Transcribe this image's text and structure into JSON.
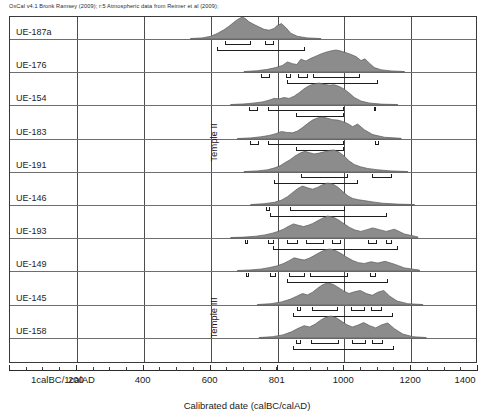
{
  "header": {
    "note": "OxCal v4.1 Bronk Ramsey (2009); r:5 Atmospheric data from Reimer et al (2009);"
  },
  "axis": {
    "title": "Calibrated date (calBC/calAD)",
    "tick_labels": [
      "1calBC/1calAD",
      "200",
      "400",
      "600",
      "801",
      "1000",
      "1200",
      "1400"
    ],
    "tick_values": [
      0,
      200,
      400,
      600,
      801,
      1000,
      1200,
      1400
    ],
    "gridline_values": [
      200,
      400,
      600,
      801,
      1000,
      1200
    ],
    "xmin": 0,
    "xmax": 1400,
    "minor_tick_step": 50
  },
  "groups": [
    {
      "label": "Temple II",
      "top": 90,
      "height": 105
    },
    {
      "label": "Temple III",
      "top": 282,
      "height": 72
    }
  ],
  "chart_data": {
    "type": "area",
    "title": "",
    "subtitle": "OxCal v4.1 Bronk Ramsey (2009); r:5 Atmospheric data from Reimer et al (2009);",
    "xlabel": "Calibrated date (calBC/calAD)",
    "ylabel": "",
    "xlim": [
      0,
      1400
    ],
    "grid": true,
    "legend": "none",
    "x_tick_labels": [
      "1calBC/1calAD",
      "200",
      "400",
      "600",
      "801",
      "1000",
      "1200",
      "1400"
    ],
    "x_tick_values": [
      0,
      200,
      400,
      600,
      801,
      1000,
      1200,
      1400
    ],
    "group_labels": [
      "Temple II",
      "Temple III"
    ],
    "series": [
      {
        "name": "UE-187a",
        "group": "Temple II",
        "curve_x": [
          540,
          575,
          600,
          620,
          640,
          655,
          668,
          680,
          695,
          705,
          715,
          725,
          735,
          745,
          760,
          775,
          790,
          800,
          812,
          825,
          840,
          860,
          890,
          930
        ],
        "curve_y": [
          0.02,
          0.05,
          0.12,
          0.25,
          0.42,
          0.58,
          0.74,
          0.88,
          1.0,
          0.92,
          0.78,
          0.7,
          0.62,
          0.55,
          0.44,
          0.4,
          0.48,
          0.62,
          0.7,
          0.52,
          0.26,
          0.12,
          0.05,
          0.02
        ],
        "ranges_68": [
          [
            642,
            720
          ],
          [
            762,
            790
          ]
        ],
        "range_95": [
          618,
          884
        ]
      },
      {
        "name": "UE-176",
        "group": "Temple II",
        "curve_x": [
          700,
          740,
          770,
          795,
          815,
          830,
          845,
          858,
          870,
          885,
          900,
          915,
          930,
          945,
          960,
          975,
          990,
          1005,
          1020,
          1035,
          1050,
          1062,
          1075,
          1090,
          1110,
          1140,
          1180
        ],
        "curve_y": [
          0.02,
          0.06,
          0.12,
          0.2,
          0.3,
          0.46,
          0.38,
          0.34,
          0.58,
          0.5,
          0.62,
          0.72,
          0.82,
          0.9,
          0.96,
          1.0,
          0.95,
          0.88,
          0.8,
          0.7,
          0.52,
          0.6,
          0.4,
          0.2,
          0.1,
          0.05,
          0.02
        ],
        "ranges_68": [
          [
            752,
            778
          ],
          [
            826,
            842
          ],
          [
            862,
            892
          ],
          [
            906,
            1048
          ]
        ],
        "range_95": [
          828,
          1102
        ]
      },
      {
        "name": "UE-154",
        "group": "Temple II",
        "curve_x": [
          660,
          700,
          730,
          755,
          775,
          790,
          805,
          820,
          835,
          850,
          865,
          880,
          895,
          910,
          925,
          940,
          955,
          970,
          985,
          1000,
          1015,
          1030,
          1050,
          1075,
          1110,
          1160
        ],
        "curve_y": [
          0.02,
          0.05,
          0.09,
          0.14,
          0.22,
          0.3,
          0.28,
          0.34,
          0.3,
          0.4,
          0.56,
          0.74,
          0.88,
          0.96,
          1.0,
          0.94,
          0.9,
          0.92,
          0.84,
          0.72,
          0.54,
          0.34,
          0.18,
          0.09,
          0.04,
          0.02
        ],
        "ranges_68": [
          [
            716,
            742
          ],
          [
            772,
            1000
          ]
        ],
        "range_95": [
          856,
          1000
        ],
        "extra_marks": [
          [
            1088,
            1096
          ]
        ]
      },
      {
        "name": "UE-183",
        "group": "Temple II",
        "curve_x": [
          680,
          720,
          750,
          775,
          795,
          812,
          828,
          845,
          860,
          875,
          890,
          905,
          920,
          935,
          950,
          965,
          980,
          995,
          1010,
          1025,
          1040,
          1060,
          1085,
          1120,
          1170
        ],
        "curve_y": [
          0.02,
          0.05,
          0.1,
          0.16,
          0.24,
          0.34,
          0.3,
          0.28,
          0.36,
          0.52,
          0.7,
          0.86,
          0.96,
          1.0,
          0.94,
          0.88,
          0.86,
          0.8,
          0.7,
          0.56,
          0.68,
          0.42,
          0.2,
          0.08,
          0.03
        ],
        "ranges_68": [
          [
            718,
            744
          ],
          [
            772,
            998
          ]
        ],
        "range_95": [
          856,
          998
        ],
        "extra_marks": [
          [
            1092,
            1104
          ]
        ]
      },
      {
        "name": "UE-191",
        "group": "Temple II",
        "curve_x": [
          700,
          740,
          770,
          790,
          808,
          822,
          838,
          852,
          868,
          882,
          896,
          910,
          925,
          940,
          955,
          970,
          985,
          1000,
          1015,
          1030,
          1048,
          1070,
          1100,
          1140,
          1190
        ],
        "curve_y": [
          0.02,
          0.05,
          0.1,
          0.18,
          0.28,
          0.42,
          0.56,
          0.72,
          0.86,
          0.94,
          0.88,
          0.82,
          0.86,
          0.92,
          0.98,
          1.0,
          0.9,
          0.72,
          0.5,
          0.34,
          0.24,
          0.16,
          0.1,
          0.05,
          0.02
        ],
        "ranges_68": [
          [
            872,
            1012
          ]
        ],
        "range_95": [
          790,
          1040
        ],
        "extra_ranges_68": [
          [
            1082,
            1142
          ]
        ]
      },
      {
        "name": "UE-146",
        "group": "Temple II",
        "curve_x": [
          720,
          760,
          790,
          812,
          830,
          845,
          860,
          875,
          890,
          905,
          920,
          935,
          950,
          965,
          980,
          995,
          1010,
          1025,
          1042,
          1060,
          1085,
          1115,
          1160,
          1210
        ],
        "curve_y": [
          0.02,
          0.06,
          0.12,
          0.22,
          0.38,
          0.56,
          0.74,
          0.86,
          0.78,
          0.72,
          0.8,
          0.92,
          1.0,
          0.96,
          0.82,
          0.62,
          0.42,
          0.3,
          0.24,
          0.2,
          0.14,
          0.08,
          0.04,
          0.02
        ],
        "ranges_68": [
          [
            838,
            1002
          ]
        ],
        "range_95": [
          778,
          1128
        ],
        "extra_marks": [
          [
            766,
            778
          ]
        ]
      },
      {
        "name": "UE-193",
        "group": "Temple III",
        "curve_x": [
          660,
          700,
          735,
          762,
          785,
          802,
          818,
          832,
          848,
          862,
          878,
          892,
          906,
          920,
          935,
          950,
          968,
          985,
          1000,
          1016,
          1032,
          1050,
          1068,
          1085,
          1105,
          1125,
          1150,
          1180,
          1220
        ],
        "curve_y": [
          0.02,
          0.04,
          0.08,
          0.14,
          0.22,
          0.3,
          0.4,
          0.52,
          0.64,
          0.58,
          0.52,
          0.58,
          0.66,
          0.78,
          0.9,
          1.0,
          0.94,
          0.8,
          0.64,
          0.48,
          0.36,
          0.3,
          0.38,
          0.46,
          0.38,
          0.3,
          0.4,
          0.18,
          0.05
        ],
        "ranges_68": [
          [
            772,
            790
          ],
          [
            830,
            862
          ],
          [
            884,
            940
          ],
          [
            962,
            990
          ],
          [
            1072,
            1098
          ],
          [
            1124,
            1142
          ]
        ],
        "range_95": [
          788,
          1160
        ],
        "extra_marks": [
          [
            704,
            712
          ]
        ]
      },
      {
        "name": "UE-149",
        "group": "Temple III",
        "curve_x": [
          680,
          720,
          752,
          778,
          800,
          818,
          834,
          850,
          866,
          880,
          895,
          910,
          926,
          942,
          958,
          975,
          992,
          1008,
          1025,
          1042,
          1060,
          1080,
          1100,
          1122,
          1148,
          1180,
          1225
        ],
        "curve_y": [
          0.02,
          0.05,
          0.09,
          0.16,
          0.24,
          0.34,
          0.46,
          0.6,
          0.54,
          0.5,
          0.58,
          0.7,
          0.84,
          0.96,
          1.0,
          0.92,
          0.78,
          0.62,
          0.48,
          0.38,
          0.34,
          0.42,
          0.36,
          0.44,
          0.32,
          0.14,
          0.04
        ],
        "ranges_68": [
          [
            778,
            796
          ],
          [
            836,
            884
          ],
          [
            896,
            1012
          ]
        ],
        "range_95": [
          830,
          1130
        ],
        "extra_marks": [
          [
            706,
            714
          ],
          [
            1078,
            1094
          ]
        ]
      },
      {
        "name": "UE-145",
        "group": "Temple III",
        "curve_x": [
          740,
          780,
          812,
          838,
          858,
          875,
          890,
          905,
          920,
          935,
          950,
          966,
          982,
          998,
          1014,
          1030,
          1048,
          1066,
          1084,
          1100,
          1118,
          1136,
          1158,
          1190,
          1235
        ],
        "curve_y": [
          0.02,
          0.06,
          0.14,
          0.26,
          0.4,
          0.52,
          0.46,
          0.58,
          0.76,
          0.92,
          1.0,
          0.94,
          0.8,
          0.64,
          0.52,
          0.6,
          0.66,
          0.52,
          0.44,
          0.58,
          0.66,
          0.4,
          0.18,
          0.06,
          0.02
        ],
        "ranges_68": [
          [
            858,
            870
          ],
          [
            902,
            982
          ],
          [
            1020,
            1062
          ],
          [
            1080,
            1112
          ]
        ],
        "range_95": [
          848,
          1146
        ]
      },
      {
        "name": "UE-158",
        "group": "Temple III",
        "curve_x": [
          745,
          785,
          816,
          842,
          862,
          880,
          896,
          912,
          928,
          944,
          960,
          976,
          992,
          1008,
          1024,
          1040,
          1058,
          1076,
          1094,
          1112,
          1130,
          1150,
          1175,
          1205,
          1245
        ],
        "curve_y": [
          0.02,
          0.06,
          0.14,
          0.28,
          0.44,
          0.56,
          0.5,
          0.62,
          0.8,
          0.94,
          1.0,
          0.92,
          0.76,
          0.6,
          0.5,
          0.58,
          0.7,
          0.56,
          0.46,
          0.6,
          0.68,
          0.42,
          0.18,
          0.06,
          0.02
        ],
        "ranges_68": [
          [
            856,
            872
          ],
          [
            900,
            984
          ],
          [
            1022,
            1064
          ],
          [
            1082,
            1116
          ]
        ],
        "range_95": [
          846,
          1150
        ]
      }
    ]
  }
}
